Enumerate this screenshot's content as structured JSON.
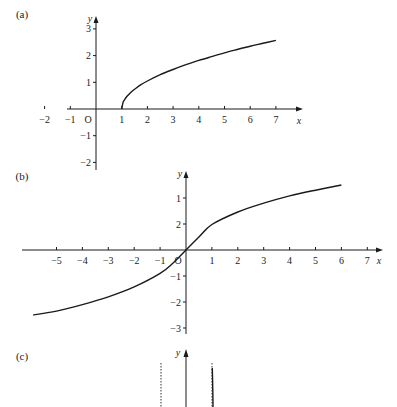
{
  "chart_data": [
    {
      "type": "line",
      "panel_label": "(a)",
      "xlabel": "x",
      "ylabel": "y",
      "origin_label": "O",
      "xlim": [
        -2.7,
        8
      ],
      "ylim": [
        -2.3,
        3.5
      ],
      "x_ticks": [
        -2,
        -1,
        1,
        2,
        3,
        4,
        5,
        6,
        7
      ],
      "x_tick_labels": [
        "−2",
        "−1",
        "1",
        "2",
        "3",
        "4",
        "5",
        "6",
        "7"
      ],
      "y_ticks": [
        3,
        2,
        1,
        -1,
        -2
      ],
      "y_tick_labels": [
        "3",
        "2",
        "1",
        "−1",
        "−2"
      ],
      "grid": false,
      "series": [
        {
          "name": "curve",
          "x": [
            1,
            1.05,
            1.1,
            1.2,
            1.35,
            1.5,
            1.75,
            2,
            2.5,
            3,
            3.5,
            4,
            4.5,
            5,
            5.5,
            6,
            6.5,
            7
          ],
          "y": [
            0,
            0.24,
            0.33,
            0.47,
            0.62,
            0.74,
            0.91,
            1.05,
            1.29,
            1.48,
            1.66,
            1.82,
            1.96,
            2.1,
            2.23,
            2.35,
            2.46,
            2.57
          ]
        }
      ]
    },
    {
      "type": "line",
      "panel_label": "(b)",
      "xlabel": "x",
      "ylabel": "y",
      "origin_label": "O",
      "xlim": [
        -6.2,
        7.7
      ],
      "ylim": [
        -3.1,
        2.1
      ],
      "x_ticks": [
        -5,
        -4,
        -3,
        -2,
        -1,
        1,
        2,
        3,
        4,
        5,
        6,
        7
      ],
      "x_tick_labels": [
        "−5",
        "−4",
        "−3",
        "−2",
        "−1",
        "1",
        "2",
        "3",
        "4",
        "5",
        "6",
        "7"
      ],
      "y_ticks": [
        2,
        1,
        -1,
        -2,
        -3
      ],
      "y_tick_labels": [
        "1",
        "2",
        "−1",
        "−2",
        "−3"
      ],
      "grid": false,
      "series": [
        {
          "name": "curve",
          "x": [
            -5.9,
            -5,
            -4,
            -3,
            -2,
            -1,
            -0.5,
            0,
            0.5,
            1,
            2,
            3,
            4,
            5,
            6
          ],
          "y": [
            -2.5,
            -2.35,
            -2.1,
            -1.8,
            -1.42,
            -0.9,
            -0.5,
            0,
            0.5,
            0.98,
            1.46,
            1.8,
            2.08,
            2.3,
            2.5
          ]
        }
      ]
    },
    {
      "type": "line",
      "panel_label": "(c)",
      "ylabel": "y",
      "note": "partially visible; vertical asymptotes shown as dotted lines",
      "asymptotes_x_relative": [
        "left-of-y-axis",
        "right-of-y-axis"
      ],
      "series": [
        {
          "name": "curve-near-right-asymptote",
          "visible": "steep branch rising along right asymptote"
        }
      ]
    }
  ]
}
